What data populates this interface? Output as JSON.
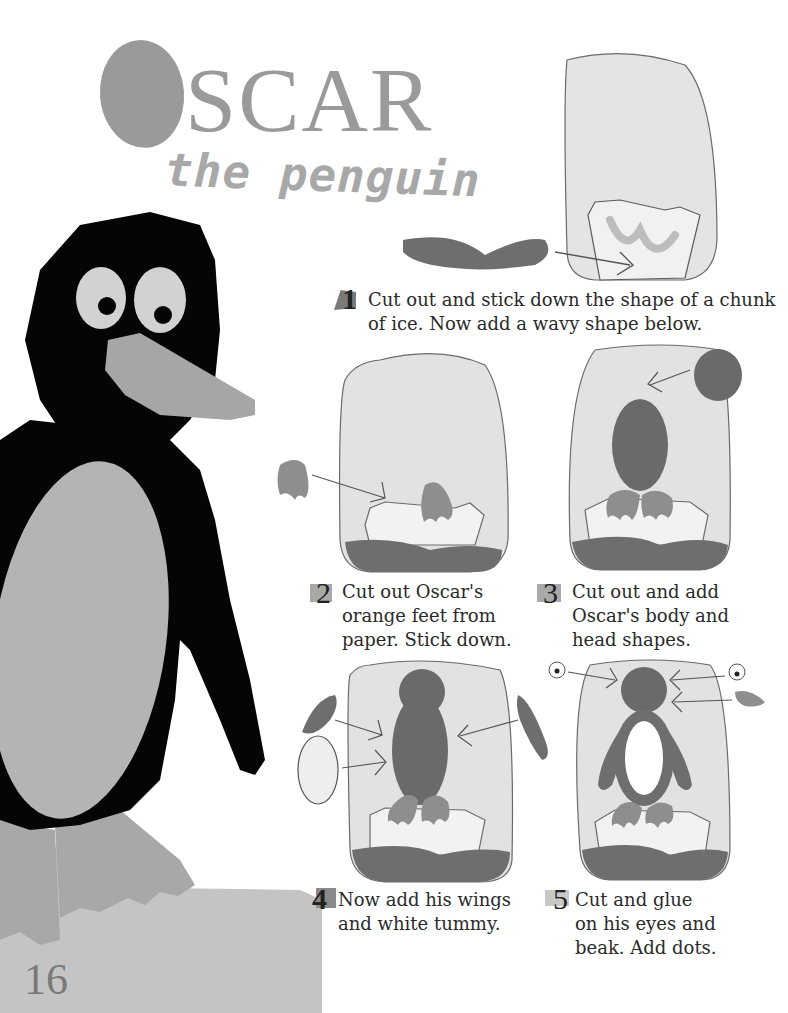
{
  "page": {
    "title_initial": "O",
    "title_rest": "SCAR",
    "subtitle": "the penguin",
    "page_number": "16"
  },
  "colors": {
    "title_grey": "#9a9a9a",
    "penguin_black": "#050505",
    "tummy_grey": "#b4b4b4",
    "beak_grey": "#a6a6a6",
    "frame_bg": "#e2e2e2",
    "wave_dark": "#6e6e6e",
    "body_dark": "#6a6a6a",
    "feet_grey": "#8e8e8e",
    "ice_grey": "#c8c8c8",
    "badge_grey": "#a9a9a9"
  },
  "steps": [
    {
      "number": "1",
      "lines": [
        "Cut out and stick down the shape of a chunk",
        "of ice. Now add a wavy shape below."
      ]
    },
    {
      "number": "2",
      "lines": [
        "Cut out Oscar's",
        "orange feet from",
        "paper. Stick down."
      ]
    },
    {
      "number": "3",
      "lines": [
        "Cut out and add",
        "Oscar's body and",
        "head shapes."
      ]
    },
    {
      "number": "4",
      "lines": [
        "Now add his wings",
        "and white tummy."
      ]
    },
    {
      "number": "5",
      "lines": [
        "Cut and glue",
        "on his eyes and",
        "beak. Add dots."
      ]
    }
  ],
  "illustrations": [
    {
      "id": "step-1",
      "depicts": "ice chunk in frame with wavy shape arrow"
    },
    {
      "id": "step-2",
      "depicts": "feet added to ice"
    },
    {
      "id": "step-3",
      "depicts": "body and head shapes"
    },
    {
      "id": "step-4",
      "depicts": "wings and white tummy"
    },
    {
      "id": "step-5",
      "depicts": "eyes and beak"
    }
  ]
}
